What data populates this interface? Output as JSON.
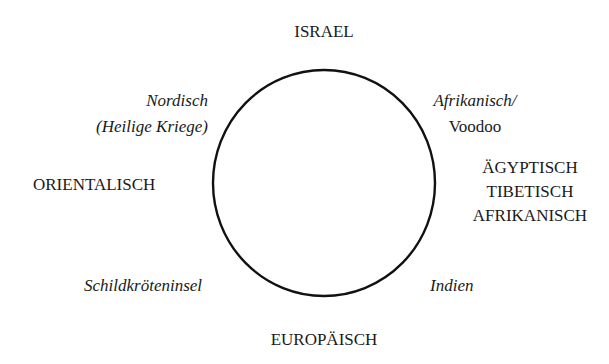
{
  "diagram": {
    "circle": {
      "cx": 324,
      "cy": 183,
      "rx": 111,
      "ry": 113,
      "stroke": "#111111",
      "stroke_width": 2.4,
      "fill": "none"
    },
    "labels": {
      "top": {
        "text": "ISRAEL",
        "style": "upright-caps"
      },
      "top_left": {
        "lines": [
          "Nordisch",
          "(Heilige Kriege)"
        ],
        "style": "italic"
      },
      "top_right": {
        "lines": [
          "Afrikanisch/",
          "Voodoo"
        ],
        "styles": [
          "italic",
          "upright"
        ]
      },
      "left": {
        "text": "ORIENTALISCH",
        "style": "upright-caps"
      },
      "right": {
        "lines": [
          "ÄGYPTISCH",
          "TIBETISCH",
          "AFRIKANISCH"
        ],
        "style": "upright-caps"
      },
      "bottom_left": {
        "text": "Schildkröteninsel",
        "style": "italic"
      },
      "bottom_right": {
        "text": "Indien",
        "style": "italic"
      },
      "bottom": {
        "text": "EUROPÄISCH",
        "style": "upright-caps"
      }
    },
    "colors": {
      "background": "#ffffff",
      "text": "#1a1a1a",
      "line": "#111111"
    }
  }
}
